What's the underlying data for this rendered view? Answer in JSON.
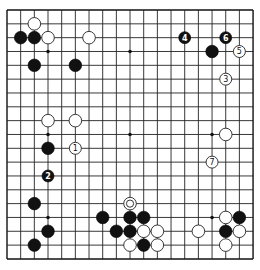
{
  "board": {
    "size": 19,
    "origin_px": [
      7,
      10
    ],
    "spacing_px": [
      13.67,
      13.83
    ],
    "colors": {
      "line": "#222222",
      "black": "#111111",
      "white": "#ffffff",
      "background": "#ffffff"
    },
    "star_points": [
      [
        3,
        3
      ],
      [
        9,
        3
      ],
      [
        15,
        3
      ],
      [
        3,
        9
      ],
      [
        9,
        9
      ],
      [
        15,
        9
      ],
      [
        3,
        15
      ],
      [
        9,
        15
      ],
      [
        15,
        15
      ]
    ],
    "stones": [
      {
        "color": "white",
        "col": 2,
        "row": 1
      },
      {
        "color": "black",
        "col": 1,
        "row": 2
      },
      {
        "color": "black",
        "col": 2,
        "row": 2
      },
      {
        "color": "white",
        "col": 3,
        "row": 2
      },
      {
        "color": "white",
        "col": 6,
        "row": 2
      },
      {
        "color": "black",
        "col": 2,
        "row": 4
      },
      {
        "color": "black",
        "col": 5,
        "row": 4
      },
      {
        "color": "black",
        "col": 13,
        "row": 2,
        "label": "4"
      },
      {
        "color": "black",
        "col": 16,
        "row": 2,
        "label": "6"
      },
      {
        "color": "black",
        "col": 15,
        "row": 3
      },
      {
        "color": "white",
        "col": 17,
        "row": 3,
        "label": "5"
      },
      {
        "color": "white",
        "col": 16,
        "row": 5,
        "label": "3"
      },
      {
        "color": "white",
        "col": 3,
        "row": 8
      },
      {
        "color": "white",
        "col": 5,
        "row": 8
      },
      {
        "color": "black",
        "col": 3,
        "row": 10
      },
      {
        "color": "white",
        "col": 5,
        "row": 10,
        "label": "1"
      },
      {
        "color": "black",
        "col": 3,
        "row": 12,
        "label": "2"
      },
      {
        "color": "white",
        "col": 16,
        "row": 9
      },
      {
        "color": "white",
        "col": 15,
        "row": 11,
        "label": "7"
      },
      {
        "color": "black",
        "col": 2,
        "row": 14
      },
      {
        "color": "black",
        "col": 3,
        "row": 16
      },
      {
        "color": "black",
        "col": 2,
        "row": 17
      },
      {
        "color": "white",
        "col": 9,
        "row": 14,
        "marker": "double-ring"
      },
      {
        "color": "black",
        "col": 7,
        "row": 15
      },
      {
        "color": "black",
        "col": 9,
        "row": 15
      },
      {
        "color": "black",
        "col": 10,
        "row": 15
      },
      {
        "color": "black",
        "col": 8,
        "row": 16
      },
      {
        "color": "black",
        "col": 9,
        "row": 16
      },
      {
        "color": "white",
        "col": 10,
        "row": 16
      },
      {
        "color": "white",
        "col": 11,
        "row": 16
      },
      {
        "color": "white",
        "col": 9,
        "row": 17
      },
      {
        "color": "black",
        "col": 10,
        "row": 17
      },
      {
        "color": "white",
        "col": 11,
        "row": 17
      },
      {
        "color": "white",
        "col": 16,
        "row": 15
      },
      {
        "color": "black",
        "col": 17,
        "row": 15
      },
      {
        "color": "white",
        "col": 14,
        "row": 16
      },
      {
        "color": "black",
        "col": 16,
        "row": 16
      },
      {
        "color": "white",
        "col": 17,
        "row": 16
      },
      {
        "color": "white",
        "col": 16,
        "row": 17
      }
    ]
  }
}
